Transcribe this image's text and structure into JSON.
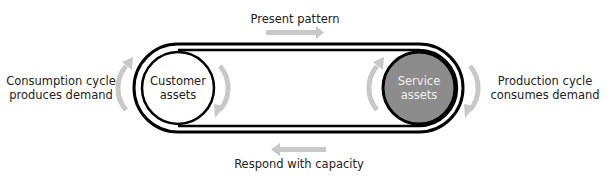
{
  "diagram": {
    "top_label": "Present pattern",
    "bottom_label": "Respond with capacity",
    "left_label": [
      "Consumption cycle",
      "produces demand"
    ],
    "right_label": [
      "Production cycle",
      "consumes demand"
    ],
    "left_node": [
      "Customer",
      "assets"
    ],
    "right_node": [
      "Service",
      "assets"
    ]
  },
  "colors": {
    "line": "#000000",
    "arrow": "#c8c8c8",
    "service_fill": "#8c8c8c",
    "customer_fill": "#ffffff",
    "service_text": "#f0f0f0",
    "text": "#222222"
  },
  "icons": {
    "top_arrow": "arrow-right-icon",
    "bottom_arrow": "arrow-left-icon",
    "left_cycle": "curved-arrow-up-icon",
    "right_cycle": "curved-arrow-down-icon"
  }
}
